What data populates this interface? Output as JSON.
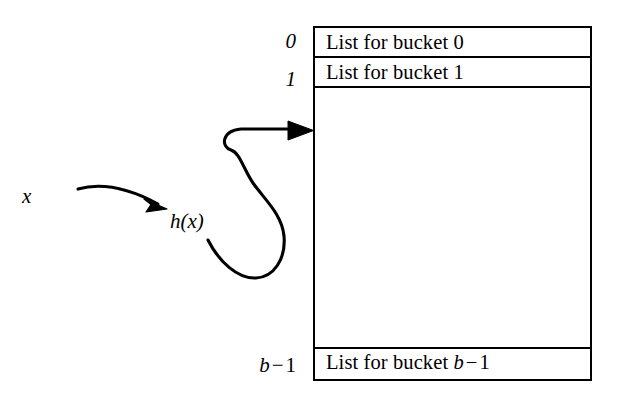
{
  "diagram": {
    "line_color": "#000000",
    "background_color": "#ffffff",
    "input_label": "x",
    "hash_label": "h(x)",
    "arrow_from_x_to_h": "arrow",
    "arrow_from_h_to_bucket": "arrow"
  },
  "table": {
    "index_labels": {
      "first": "0",
      "second": "1",
      "last_prefix": "b",
      "last_minus": "−",
      "last_suffix": "1"
    },
    "rows": [
      {
        "name": "row-bucket-0",
        "text": "List for bucket 0",
        "index": "0"
      },
      {
        "name": "row-bucket-1",
        "text": "List for bucket 1",
        "index": "1"
      },
      {
        "name": "row-empty",
        "text": "",
        "index": ""
      },
      {
        "name": "row-bucket-last",
        "text_prefix": "List for bucket",
        "text_var": "b",
        "text_minus": "−",
        "text_suffix": "1"
      }
    ]
  },
  "labels": {
    "x": "x",
    "h_prefix": "h(",
    "h_var": "x",
    "h_suffix": ")"
  }
}
